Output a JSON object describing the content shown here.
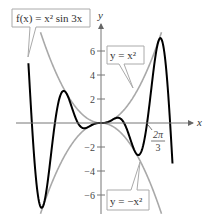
{
  "chart_data": {
    "type": "line",
    "title": "",
    "xlabel": "x",
    "ylabel": "y",
    "xlim": [
      -3.9,
      4.2
    ],
    "ylim": [
      -7.7,
      7.8
    ],
    "grid": false,
    "y_ticks": [
      6,
      4,
      2,
      -2,
      -4,
      -6
    ],
    "y_tick_labels": [
      "6",
      "4",
      "2",
      "−2",
      "−4",
      "−6"
    ],
    "x_annotation": {
      "value": 2.0944,
      "label_num": "2π",
      "label_den": "3"
    },
    "series": [
      {
        "name": "f(x) = x² sin 3x",
        "expr": "x^2*sin(3x)",
        "color": "#000000",
        "domain": [
          -3.3,
          3.25
        ]
      },
      {
        "name": "y = x²",
        "expr": "x^2",
        "color": "#a9a9a9",
        "domain": [
          -2.75,
          2.75
        ]
      },
      {
        "name": "y = −x²",
        "expr": "-x^2",
        "color": "#a9a9a9",
        "domain": [
          -2.75,
          2.75
        ]
      }
    ],
    "callouts": [
      {
        "text": "f(x) = x² sin 3x",
        "points_to": "f"
      },
      {
        "text": "y = x²",
        "points_to": "upper-envelope"
      },
      {
        "text": "y = −x²",
        "points_to": "lower-envelope"
      }
    ]
  }
}
